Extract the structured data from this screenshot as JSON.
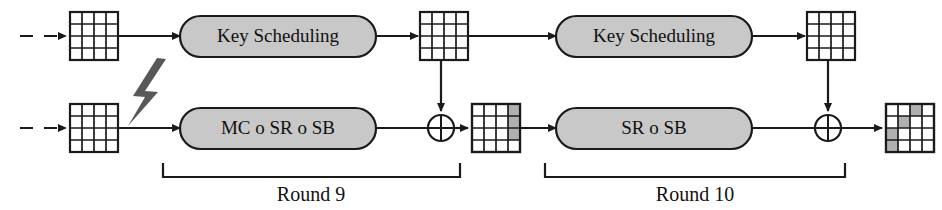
{
  "diagram": {
    "colors": {
      "line": "#1a1a1a",
      "box_fill": "#c8c8c8",
      "box_stroke": "#1a1a1a",
      "cell_shaded": "#b0b0b0",
      "cell_plain": "#ffffff",
      "bolt_fill": "#585858",
      "text": "#111111"
    },
    "processes": [
      {
        "id": "key-scheduling-9",
        "label": "Key Scheduling"
      },
      {
        "id": "mc-sr-sb-9",
        "label": "MC o SR o SB"
      },
      {
        "id": "key-scheduling-10",
        "label": "Key Scheduling"
      },
      {
        "id": "sr-sb-10",
        "label": "SR o SB"
      }
    ],
    "rounds": [
      {
        "id": "round-9",
        "label": "Round 9"
      },
      {
        "id": "round-10",
        "label": "Round 10"
      }
    ],
    "operators": [
      {
        "id": "xor-round-9",
        "symbol": "XOR"
      },
      {
        "id": "xor-round-10",
        "symbol": "XOR"
      }
    ],
    "fault": {
      "id": "fault-injection",
      "icon": "lightning-bolt-icon"
    },
    "states": [
      {
        "id": "state-key-in",
        "row": "top",
        "position": "input",
        "shaded_cells": []
      },
      {
        "id": "state-data-in",
        "row": "bottom",
        "position": "input",
        "shaded_cells": []
      },
      {
        "id": "state-roundkey-9",
        "row": "top",
        "position": "mid",
        "shaded_cells": []
      },
      {
        "id": "state-after-xor-9",
        "row": "bottom",
        "position": "mid",
        "shaded_cells": [
          [
            0,
            3
          ],
          [
            1,
            3
          ],
          [
            2,
            3
          ]
        ]
      },
      {
        "id": "state-roundkey-10",
        "row": "top",
        "position": "right",
        "shaded_cells": []
      },
      {
        "id": "state-ciphertext",
        "row": "bottom",
        "position": "output",
        "shaded_cells": [
          [
            0,
            2
          ],
          [
            1,
            1
          ],
          [
            2,
            0
          ],
          [
            3,
            0
          ]
        ]
      }
    ]
  }
}
